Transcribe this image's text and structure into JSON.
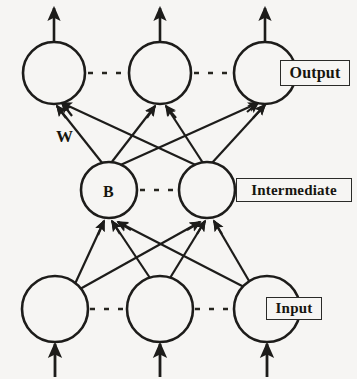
{
  "figure": {
    "kind": "neural-network-architecture-diagram",
    "background_color": "#f6f5f3",
    "stroke_color": "#1d1c1a",
    "text_color": "#16150f"
  },
  "layers": {
    "output": {
      "label": "Output",
      "node_count_shown": 3,
      "ellipsis_between_nodes": true,
      "has_outgoing_arrows": true,
      "nodes": [
        {
          "id": "out-1",
          "label": "",
          "cx": 54,
          "cy": 73,
          "r": 31
        },
        {
          "id": "out-2",
          "label": "",
          "cx": 160,
          "cy": 73,
          "r": 31
        },
        {
          "id": "out-3",
          "label": "",
          "cx": 265,
          "cy": 73,
          "r": 31
        }
      ]
    },
    "intermediate": {
      "label": "Intermediate",
      "node_count_shown": 2,
      "ellipsis_between_nodes": true,
      "nodes": [
        {
          "id": "int-1",
          "label": "B",
          "cx": 109,
          "cy": 190,
          "r": 28
        },
        {
          "id": "int-2",
          "label": "",
          "cx": 207,
          "cy": 190,
          "r": 28
        }
      ]
    },
    "input": {
      "label": "Input",
      "node_count_shown": 3,
      "ellipsis_between_nodes": true,
      "has_incoming_arrows": true,
      "nodes": [
        {
          "id": "in-1",
          "label": "",
          "cx": 55,
          "cy": 309,
          "r": 33
        },
        {
          "id": "in-2",
          "label": "",
          "cx": 160,
          "cy": 309,
          "r": 33
        },
        {
          "id": "in-3",
          "label": "",
          "cx": 267,
          "cy": 309,
          "r": 33
        }
      ]
    }
  },
  "annotations": {
    "weight_symbol": "W",
    "bias_symbol": "B"
  },
  "connections": {
    "intermediate_to_output": [
      {
        "from": "int-1",
        "to": "out-1"
      },
      {
        "from": "int-1",
        "to": "out-2"
      },
      {
        "from": "int-1",
        "to": "out-3"
      },
      {
        "from": "int-2",
        "to": "out-1"
      },
      {
        "from": "int-2",
        "to": "out-2"
      },
      {
        "from": "int-2",
        "to": "out-3"
      }
    ],
    "input_to_intermediate": [
      {
        "from": "in-1",
        "to": "int-1"
      },
      {
        "from": "in-1",
        "to": "int-2"
      },
      {
        "from": "in-2",
        "to": "int-1"
      },
      {
        "from": "in-2",
        "to": "int-2"
      },
      {
        "from": "in-3",
        "to": "int-1"
      },
      {
        "from": "in-3",
        "to": "int-2"
      }
    ]
  }
}
